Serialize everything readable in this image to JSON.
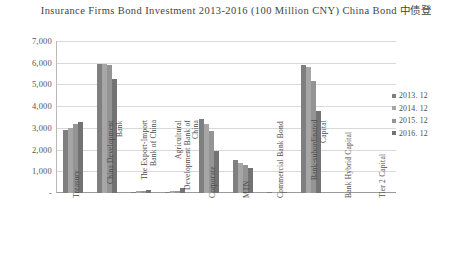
{
  "chart": {
    "title": "Insurance Firms Bond Investment 2013-2016 (100 Million CNY) China Bond 中债登"
  },
  "chart_data": {
    "type": "bar",
    "title": "Insurance Firms Bond Investment 2013-2016 (100 Million CNY) China Bond 中债登",
    "xlabel": "",
    "ylabel": "",
    "ylim": [
      0,
      7000
    ],
    "ytick_labels": [
      "7,000",
      "6,000",
      "5,000",
      "4,000",
      "3,000",
      "2,000",
      "1,000",
      "-"
    ],
    "ytick_values": [
      7000,
      6000,
      5000,
      4000,
      3000,
      2000,
      1000,
      0
    ],
    "grid": true,
    "legend_position": "right",
    "categories": [
      "Treasury",
      "China Development Bank",
      "The Export-Import Bank of China",
      "Agricultural Development Bank of China",
      "Corporate",
      "MTN",
      "Commercial Bank Bond",
      "Bank-subordinated Capital",
      "Bank Hybrid Capital",
      "Tier 2 Capital"
    ],
    "series": [
      {
        "name": "2013. 12",
        "color": "#7f7f7f",
        "values": [
          2900,
          5950,
          60,
          60,
          3400,
          1500,
          30,
          5900,
          0,
          0
        ]
      },
      {
        "name": "2014. 12",
        "color": "#a6a6a6",
        "values": [
          3000,
          5950,
          70,
          80,
          3200,
          1400,
          30,
          5800,
          0,
          0
        ]
      },
      {
        "name": "2015. 12",
        "color": "#949494",
        "values": [
          3200,
          5900,
          90,
          110,
          2850,
          1300,
          25,
          5150,
          0,
          0
        ]
      },
      {
        "name": "2016. 12",
        "color": "#737373",
        "values": [
          3250,
          5250,
          130,
          250,
          1950,
          1150,
          25,
          3800,
          0,
          0
        ]
      }
    ]
  }
}
